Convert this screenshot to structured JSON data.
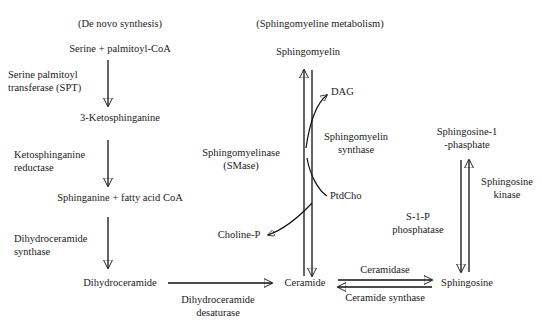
{
  "diagram": {
    "sections": {
      "de_novo": "(De novo synthesis)",
      "sphingomyelin": "(Sphingomyeline metabolism)"
    },
    "metabolites": {
      "serine_palmitoyl_coa": "Serine + palmitoyl-CoA",
      "ketosphinganine": "3-Ketosphinganine",
      "sphinganine_fatty_acid_coa": "Sphinganine + fatty acid CoA",
      "dihydroceramide": "Dihydroceramide",
      "sphingomyelin": "Sphingomyelin",
      "dag": "DAG",
      "ptdcho": "PtdCho",
      "choline_p": "Choline-P",
      "ceramide": "Ceramide",
      "sphingosine": "Sphingosine",
      "sphingosine_1_phosphate_line1": "Sphingosine-1",
      "sphingosine_1_phosphate_line2": "-phasphate"
    },
    "enzymes": {
      "spt_line1": "Serine palmitoyl",
      "spt_line2": "transferase (SPT)",
      "ketosphinganine_reductase_line1": "Ketosphinganine",
      "ketosphinganine_reductase_line2": "reductase",
      "dihydroceramide_synthase_line1": "Dihydroceramide",
      "dihydroceramide_synthase_line2": "synthase",
      "dihydroceramide_desaturase_line1": "Dihydroceramide",
      "dihydroceramide_desaturase_line2": "desaturase",
      "smase_line1": "Sphingomyelinase",
      "smase_line2": "(SMase)",
      "sm_synthase_line1": "Sphingomyelin",
      "sm_synthase_line2": "synthase",
      "ceramidase": "Ceramidase",
      "ceramide_synthase": "Ceramide synthase",
      "s1p_phosphatase_line1": "S-1-P",
      "s1p_phosphatase_line2": "phosphatase",
      "sphingosine_kinase_line1": "Sphingosine",
      "sphingosine_kinase_line2": "kinase"
    },
    "colors": {
      "stroke": "#111111",
      "text": "#1a1a1a",
      "background": "#ffffff"
    }
  }
}
